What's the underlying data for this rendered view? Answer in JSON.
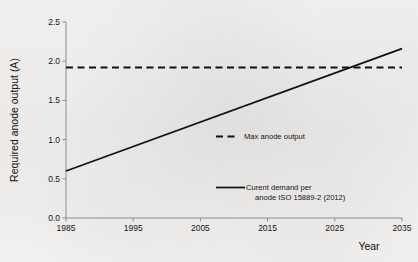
{
  "chart_data": {
    "type": "line",
    "title": "",
    "xlabel": "Year",
    "ylabel": "Required anode output (A)",
    "xlim": [
      1985,
      2035
    ],
    "ylim": [
      0.0,
      2.5
    ],
    "xticks": [
      "1985",
      "1995",
      "2005",
      "2015",
      "2025",
      "2035"
    ],
    "xtick_values": [
      1985,
      1995,
      2005,
      2015,
      2025,
      2035
    ],
    "yticks": [
      "0.0",
      "0.5",
      "1.0",
      "1.5",
      "2.0",
      "2.5"
    ],
    "ytick_values": [
      0.0,
      0.5,
      1.0,
      1.5,
      2.0,
      2.5
    ],
    "grid": false,
    "legend_position": "center-right",
    "series": [
      {
        "name": "Max anode output",
        "style": "dashed",
        "color": "#101010",
        "x": [
          1985,
          2035
        ],
        "values": [
          1.92,
          1.92
        ]
      },
      {
        "name": "Curent demand per anode ISO 15889-2 (2012)",
        "style": "solid",
        "color": "#101010",
        "x": [
          1985,
          2035
        ],
        "values": [
          0.6,
          2.16
        ]
      }
    ],
    "annotations": [
      {
        "text": "lines intersect",
        "x": 2027,
        "y": 1.92
      }
    ]
  },
  "legend": {
    "items": [
      {
        "label": "Max anode output",
        "style": "dashed",
        "line_1": "Max anode output",
        "line_2": ""
      },
      {
        "label": "Curent demand per anode ISO 15889-2 (2012)",
        "style": "solid",
        "line_1": "Curent demand per",
        "line_2": "anode ISO 15889-2 (2012)"
      }
    ]
  }
}
